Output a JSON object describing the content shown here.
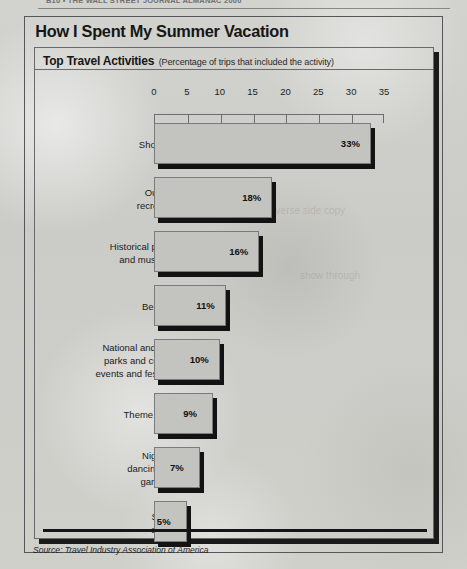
{
  "page_header": {
    "text": "B10  •  THE WALL STREET JOURNAL ALMANAC 2000"
  },
  "figure": {
    "title": "How I Spent My Summer Vacation",
    "panel_title": "Top Travel Activities",
    "panel_subtitle": "(Percentage of trips that included the activity)",
    "source": "Source: Travel Industry Association of America"
  },
  "chart_data": {
    "type": "bar",
    "orientation": "horizontal",
    "title": "Top Travel Activities",
    "subtitle": "(Percentage of trips that included the activity)",
    "xlabel": "",
    "ylabel": "",
    "xlim": [
      0,
      35
    ],
    "xticks": [
      0,
      5,
      10,
      15,
      20,
      25,
      30,
      35
    ],
    "xtick_labels": [
      "0",
      "5",
      "10",
      "15",
      "20",
      "25",
      "30",
      "35"
    ],
    "grid": false,
    "legend": false,
    "value_suffix": "%",
    "categories": [
      "Shopping",
      "Outdoor\nrecreation",
      "Historical places\nand museums",
      "Beaches",
      "National and state\nparks and cultural\nevents and festivals",
      "Theme parks",
      "Nightlife,\ndancing and\ngambling",
      "Sports\nevents"
    ],
    "values": [
      33,
      18,
      16,
      11,
      10,
      9,
      7,
      5
    ],
    "value_labels": [
      "33%",
      "18%",
      "16%",
      "11%",
      "10%",
      "9%",
      "7%",
      "5%"
    ],
    "colors": {
      "bar_fill": "#c3c3c0",
      "bar_border": "#7b7b7c",
      "bar_shadow": "#131313",
      "text": "#1b1b1b",
      "background": "#cdcdc9"
    }
  },
  "ghosts": [
    {
      "text": "the reverse side copy",
      "left": 250,
      "top": 205
    },
    {
      "text": "show through",
      "left": 300,
      "top": 270
    }
  ]
}
